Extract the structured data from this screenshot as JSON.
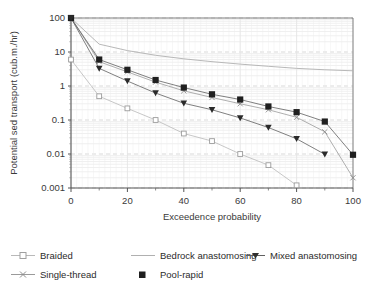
{
  "chart_data": {
    "type": "line",
    "title": "",
    "xlabel": "Exceedence probability",
    "ylabel": "Potential sed transport (cub.m./hr)",
    "yscale": "log",
    "ylim": [
      0.001,
      100
    ],
    "xlim": [
      0,
      100
    ],
    "ytick_labels": [
      "100",
      "10",
      "1",
      "0.1",
      "0.01",
      "0.001"
    ],
    "ytick_values": [
      100,
      10,
      1,
      0.1,
      0.01,
      0.001
    ],
    "xtick_labels": [
      "0",
      "20",
      "40",
      "60",
      "80",
      "100"
    ],
    "xtick_values": [
      0,
      20,
      40,
      60,
      80,
      100
    ],
    "xminor_ticks": [
      10,
      30,
      50,
      70,
      90
    ],
    "grid": "minor-log-horizontal-and-vertical",
    "legend_position": "below-plot",
    "series": [
      {
        "name": "Braided",
        "marker": "open-square",
        "color": "#b9b9b9",
        "x": [
          0,
          10,
          20,
          30,
          40,
          50,
          60,
          70,
          80
        ],
        "y": [
          6.0,
          0.5,
          0.22,
          0.1,
          0.04,
          0.024,
          0.01,
          0.0047,
          0.0012
        ]
      },
      {
        "name": "Single-thread",
        "marker": "cross",
        "color": "#9a9a9a",
        "x": [
          0,
          10,
          20,
          30,
          40,
          50,
          60,
          70,
          80,
          90,
          100
        ],
        "y": [
          100,
          5.2,
          2.6,
          1.3,
          0.72,
          0.46,
          0.3,
          0.2,
          0.12,
          0.045,
          0.002
        ]
      },
      {
        "name": "Bedrock anastomosing",
        "marker": "none",
        "color": "#b0b0b0",
        "x": [
          0,
          10,
          20,
          30,
          40,
          50,
          60,
          70,
          80,
          90,
          100
        ],
        "y": [
          100,
          17,
          11,
          8.0,
          6.3,
          5.2,
          4.4,
          3.8,
          3.3,
          3.0,
          2.8
        ]
      },
      {
        "name": "Pool-rapid",
        "marker": "filled-square",
        "color": "#606060",
        "x": [
          0,
          10,
          20,
          30,
          40,
          50,
          60,
          70,
          80,
          90,
          100
        ],
        "y": [
          100,
          6.0,
          3.0,
          1.5,
          0.9,
          0.57,
          0.4,
          0.25,
          0.17,
          0.09,
          0.0095
        ]
      },
      {
        "name": "Mixed anastomosing",
        "marker": "filled-triangle-down",
        "color": "#606060",
        "x": [
          0,
          10,
          20,
          30,
          40,
          50,
          60,
          70,
          80,
          90
        ],
        "y": [
          100,
          3.3,
          1.4,
          0.62,
          0.31,
          0.2,
          0.115,
          0.06,
          0.028,
          0.0098
        ]
      }
    ]
  },
  "legend": {
    "items": [
      {
        "label": "Braided",
        "marker": "open-square"
      },
      {
        "label": "Bedrock anastomosing",
        "marker": "none"
      },
      {
        "label": "Mixed anastomosing",
        "marker": "filled-triangle-down"
      },
      {
        "label": "Single-thread",
        "marker": "cross"
      },
      {
        "label": "Pool-rapid",
        "marker": "filled-square"
      }
    ]
  },
  "colors": {
    "axis": "#6f6f6f",
    "grid_major": "#cfcfcf",
    "grid_minor": "#e6e6e6",
    "text": "#2b2b2b",
    "dark_series": "#606060",
    "light_series": "#b5b5b5"
  }
}
